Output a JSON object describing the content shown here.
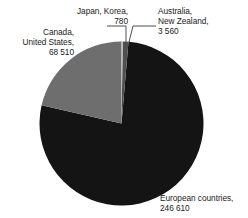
{
  "chart_data": {
    "type": "pie",
    "title": "",
    "subtitle": "",
    "xlabel": "",
    "ylabel": "",
    "legend_position": "callout-labels",
    "grid": false,
    "total": 319460,
    "categories": [
      "Japan, Korea",
      "Australia, New Zealand",
      "European countries",
      "Canada, United States"
    ],
    "values": [
      780,
      3560,
      246610,
      68510
    ],
    "slices": [
      {
        "name": "Japan, Korea",
        "value": 780,
        "value_text": "780",
        "percent": 0.24,
        "color": "#b3b3b3",
        "start_angle": 0.0,
        "end_angle": 0.88
      },
      {
        "name": "Australia, New Zealand",
        "value": 3560,
        "value_text": "3 560",
        "percent": 1.11,
        "color": "#4f4f4f",
        "start_angle": 0.88,
        "end_angle": 4.89
      },
      {
        "name": "European countries",
        "value": 246610,
        "value_text": "246 610",
        "percent": 77.2,
        "color": "#141414",
        "start_angle": 4.89,
        "end_angle": 282.83
      },
      {
        "name": "Canada, United States",
        "value": 68510,
        "value_text": "68 510",
        "percent": 21.45,
        "color": "#6e6e6e",
        "start_angle": 282.83,
        "end_angle": 360.0
      }
    ]
  },
  "labels": {
    "canada_us": {
      "line1": "Canada,",
      "line2": "United States,",
      "line3": "68 510"
    },
    "japan_korea": {
      "line1": "Japan, Korea,",
      "line2": "780"
    },
    "australia_nz": {
      "line1": "Australia,",
      "line2": "New Zealand,",
      "line3": "3 560"
    },
    "european": {
      "line1": "European countries,",
      "line2": "246 610"
    }
  },
  "colors": {
    "background": "#ffffff",
    "text": "#1b1b1b",
    "leader_line": "#3a3a3a",
    "slice_japan_korea": "#b3b3b3",
    "slice_australia_nz": "#4f4f4f",
    "slice_european": "#141414",
    "slice_canada_us": "#6e6e6e"
  }
}
